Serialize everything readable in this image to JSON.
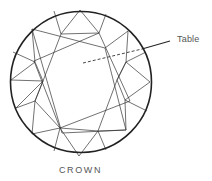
{
  "diagram": {
    "title": "CROWN",
    "callouts": [
      {
        "label": "Table"
      }
    ],
    "colors": {
      "outline": "#222222",
      "facet_lines": "#333333",
      "text": "#555555",
      "background": "#ffffff"
    }
  }
}
